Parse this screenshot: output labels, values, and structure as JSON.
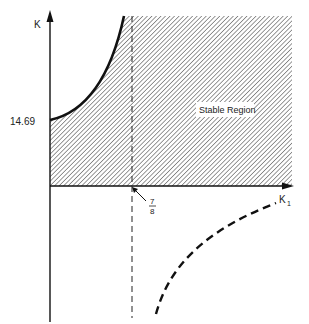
{
  "diagram": {
    "axes": {
      "y_label": "K",
      "x_label_main": "K",
      "x_label_sub": "1"
    },
    "annotations": {
      "y_intercept": "14.69",
      "x_marker_num": "7",
      "x_marker_den": "8",
      "region_label": "Stable Region"
    },
    "colors": {
      "ink": "#1a1a1a",
      "hatch": "#555555",
      "background": "#ffffff"
    }
  }
}
